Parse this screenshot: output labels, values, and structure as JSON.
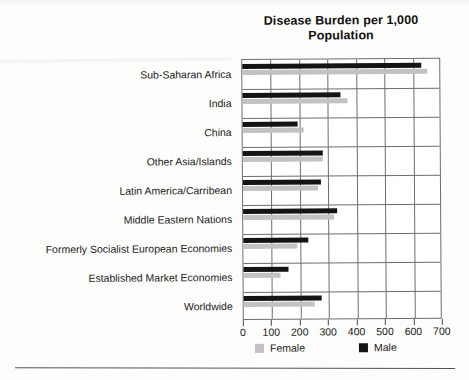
{
  "chart_data": {
    "type": "bar",
    "orientation": "horizontal",
    "title": "Disease Burden per 1,000 Population",
    "xlabel": "",
    "ylabel": "",
    "xlim": [
      0,
      700
    ],
    "xticks": [
      0,
      100,
      200,
      300,
      400,
      500,
      600,
      700
    ],
    "grid": true,
    "legend_position": "bottom",
    "categories": [
      "Sub-Saharan Africa",
      "India",
      "China",
      "Other Asia/Islands",
      "Latin America/Carribean",
      "Middle Eastern Nations",
      "Formerly Socialist European Economies",
      "Established Market Economies",
      "Worldwide"
    ],
    "series": [
      {
        "name": "Male",
        "color": "#141414",
        "values": [
          630,
          345,
          195,
          280,
          275,
          330,
          230,
          160,
          275
        ]
      },
      {
        "name": "Female",
        "color": "#c2c2c2",
        "values": [
          650,
          370,
          215,
          280,
          265,
          320,
          190,
          130,
          250
        ]
      }
    ]
  },
  "legend": {
    "items": [
      {
        "label": "Female",
        "color": "#c2c2c2"
      },
      {
        "label": "Male",
        "color": "#141414"
      }
    ]
  }
}
